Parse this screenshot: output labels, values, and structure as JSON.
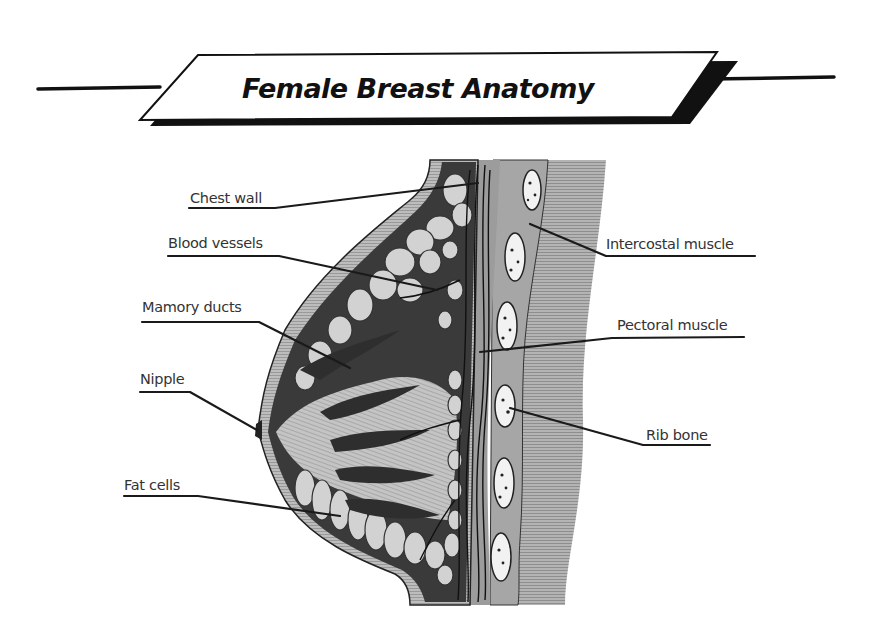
{
  "title": "Female Breast Anatomy",
  "colors": {
    "ink": "#111111",
    "dark_tissue": "#3a3a3a",
    "mid_gray": "#9a9a9a",
    "light_gray": "#c8c8c8",
    "lobule_fill": "#d2d2d2",
    "rib_fill": "#f2f2f2",
    "background": "#ffffff"
  },
  "labels": [
    {
      "id": "chest-wall",
      "text": "Chest wall",
      "side": "left"
    },
    {
      "id": "blood-vessels",
      "text": "Blood vessels",
      "side": "left"
    },
    {
      "id": "mamory-ducts",
      "text": "Mamory ducts",
      "side": "left"
    },
    {
      "id": "nipple",
      "text": "Nipple",
      "side": "left"
    },
    {
      "id": "fat-cells",
      "text": "Fat cells",
      "side": "left"
    },
    {
      "id": "intercostal-muscle",
      "text": "Intercostal muscle",
      "side": "right"
    },
    {
      "id": "pectoral-muscle",
      "text": "Pectoral muscle",
      "side": "right"
    },
    {
      "id": "rib-bone",
      "text": "Rib bone",
      "side": "right"
    }
  ]
}
